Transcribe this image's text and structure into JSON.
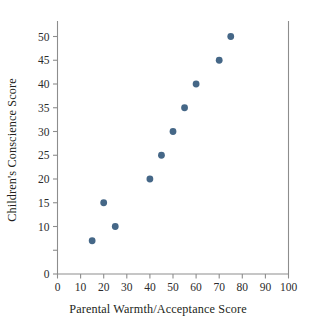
{
  "chart_data": {
    "type": "scatter",
    "title": "",
    "xlabel": "Parental Warmth/Acceptance Score",
    "ylabel": "Children's Conscience Score",
    "xlim": [
      0,
      100
    ],
    "ylim": [
      0,
      52
    ],
    "grid": false,
    "legend": null,
    "marker_color": "#456787",
    "axis_color": "#8d8d8d",
    "text_color": "#231f20",
    "background": "#ffffff",
    "x_ticks": [
      0,
      10,
      20,
      30,
      40,
      50,
      60,
      70,
      80,
      90,
      100
    ],
    "x_tick_labels": [
      "0",
      "10",
      "20",
      "30",
      "40",
      "50",
      "60",
      "70",
      "80",
      "90",
      "100"
    ],
    "y_ticks": [
      0,
      5,
      10,
      15,
      20,
      25,
      30,
      35,
      40,
      45,
      50
    ],
    "y_tick_labels": [
      "0",
      "",
      "10",
      "15",
      "20",
      "25",
      "30",
      "35",
      "40",
      "45",
      "50"
    ],
    "points": [
      {
        "x": 15,
        "y": 7
      },
      {
        "x": 20,
        "y": 15
      },
      {
        "x": 25,
        "y": 10
      },
      {
        "x": 40,
        "y": 20
      },
      {
        "x": 45,
        "y": 25
      },
      {
        "x": 50,
        "y": 30
      },
      {
        "x": 55,
        "y": 35
      },
      {
        "x": 60,
        "y": 40
      },
      {
        "x": 70,
        "y": 45
      },
      {
        "x": 75,
        "y": 50
      }
    ]
  }
}
